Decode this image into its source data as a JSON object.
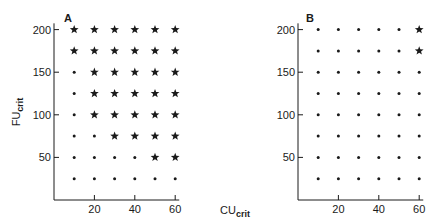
{
  "chart_data": [
    {
      "type": "scatter",
      "panel": "A",
      "xlabel": "CU_crit",
      "ylabel": "FU_crit",
      "x_ticks": [
        20,
        40,
        60
      ],
      "y_ticks": [
        50,
        100,
        150,
        200
      ],
      "xlim": [
        0,
        62
      ],
      "ylim": [
        0,
        205
      ],
      "grid": false,
      "x": [
        10,
        20,
        30,
        40,
        50,
        60
      ],
      "y": [
        25,
        50,
        75,
        100,
        125,
        150,
        175,
        200
      ],
      "legend": [],
      "markers": {
        "dot": "criterion not met",
        "star": "criterion met"
      },
      "grid_markers": {
        "200": [
          "star",
          "star",
          "star",
          "star",
          "star",
          "star"
        ],
        "175": [
          "star",
          "star",
          "star",
          "star",
          "star",
          "star"
        ],
        "150": [
          "dot",
          "star",
          "star",
          "star",
          "star",
          "star"
        ],
        "125": [
          "dot",
          "star",
          "star",
          "star",
          "star",
          "star"
        ],
        "100": [
          "dot",
          "star",
          "star",
          "star",
          "star",
          "star"
        ],
        "75": [
          "dot",
          "dot",
          "star",
          "star",
          "star",
          "star"
        ],
        "50": [
          "dot",
          "dot",
          "dot",
          "dot",
          "star",
          "star"
        ],
        "25": [
          "dot",
          "dot",
          "dot",
          "dot",
          "dot",
          "dot"
        ]
      }
    },
    {
      "type": "scatter",
      "panel": "B",
      "xlabel": "CU_crit",
      "ylabel": "FU_crit",
      "x_ticks": [
        20,
        40,
        60
      ],
      "y_ticks": [
        50,
        100,
        150,
        200
      ],
      "xlim": [
        0,
        62
      ],
      "ylim": [
        0,
        205
      ],
      "grid": false,
      "x": [
        10,
        20,
        30,
        40,
        50,
        60
      ],
      "y": [
        25,
        50,
        75,
        100,
        125,
        150,
        175,
        200
      ],
      "legend": [],
      "grid_markers": {
        "200": [
          "dot",
          "dot",
          "dot",
          "dot",
          "dot",
          "star"
        ],
        "175": [
          "dot",
          "dot",
          "dot",
          "dot",
          "dot",
          "star"
        ],
        "150": [
          "dot",
          "dot",
          "dot",
          "dot",
          "dot",
          "dot"
        ],
        "125": [
          "dot",
          "dot",
          "dot",
          "dot",
          "dot",
          "dot"
        ],
        "100": [
          "dot",
          "dot",
          "dot",
          "dot",
          "dot",
          "dot"
        ],
        "75": [
          "dot",
          "dot",
          "dot",
          "dot",
          "dot",
          "dot"
        ],
        "50": [
          "dot",
          "dot",
          "dot",
          "dot",
          "dot",
          "dot"
        ],
        "25": [
          "dot",
          "dot",
          "dot",
          "dot",
          "dot",
          "dot"
        ]
      }
    }
  ],
  "labels": {
    "panel_a": "A",
    "panel_b": "B",
    "x_axis": "CU",
    "x_axis_sub": "crit",
    "y_axis": "FU",
    "y_axis_sub": "crit"
  },
  "colors": {
    "ink": "#1a1a1a",
    "background": "#ffffff"
  }
}
